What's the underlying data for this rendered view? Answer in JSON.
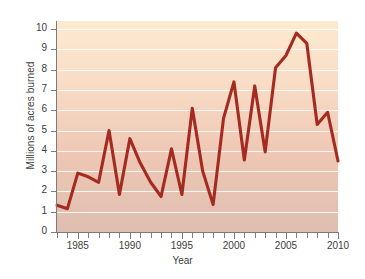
{
  "chart_data": {
    "type": "line",
    "title": "",
    "xlabel": "Year",
    "ylabel": "Millions of acres burned",
    "xlim": [
      1983,
      2010
    ],
    "ylim": [
      0,
      10.4
    ],
    "grid": true,
    "legend": null,
    "line_color": "#a32b20",
    "x": [
      1983,
      1984,
      1985,
      1986,
      1987,
      1988,
      1989,
      1990,
      1991,
      1992,
      1993,
      1994,
      1995,
      1996,
      1997,
      1998,
      1999,
      2000,
      2001,
      2002,
      2003,
      2004,
      2005,
      2006,
      2007,
      2008,
      2009,
      2010
    ],
    "values": [
      1.32,
      1.15,
      2.9,
      2.72,
      2.45,
      5.0,
      1.85,
      4.6,
      3.4,
      2.45,
      1.75,
      4.1,
      1.85,
      6.1,
      3.0,
      1.35,
      5.6,
      7.4,
      3.55,
      7.2,
      3.95,
      8.1,
      8.7,
      9.8,
      9.3,
      5.3,
      5.9,
      3.5
    ],
    "ytick_labels": [
      "0",
      "1",
      "2",
      "3",
      "4",
      "5",
      "6",
      "7",
      "8",
      "9",
      "10"
    ],
    "ytick_values": [
      0,
      1,
      2,
      3,
      4,
      5,
      6,
      7,
      8,
      9,
      10
    ],
    "xtick_labels": [
      "1985",
      "1990",
      "1995",
      "2000",
      "2005",
      "2010"
    ],
    "xtick_values": [
      1985,
      1990,
      1995,
      2000,
      2005,
      2010
    ],
    "xtick_minor_values": [
      1983,
      1984,
      1985,
      1986,
      1987,
      1988,
      1989,
      1990,
      1991,
      1992,
      1993,
      1994,
      1995,
      1996,
      1997,
      1998,
      1999,
      2000,
      2001,
      2002,
      2003,
      2004,
      2005,
      2006,
      2007,
      2008,
      2009,
      2010
    ],
    "background_gradient_top": "#fdeacf",
    "background_gradient_bottom": "#debfb2",
    "gridline_color": "#ffffff",
    "axis_color": "#7b7b7b"
  }
}
